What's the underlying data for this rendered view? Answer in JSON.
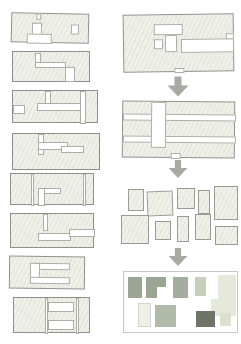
{
  "meta": {
    "icons": [
      "down-arrow-icon"
    ]
  },
  "style": {
    "page_bg": "#ffffff",
    "hatch_fill": "#eef0e9",
    "hatch_line": "#e2e4da",
    "outline": "#8f9089",
    "cut_border": "#adaea6",
    "building_border": "#9a9b93",
    "frame_border": "#c8ccbe",
    "arrow_color": "#a7aaa3"
  },
  "diagram": {
    "left_column_blocks": [
      {
        "id": "plan-block-1",
        "x": 11,
        "y": 13,
        "w": 78,
        "h": 30,
        "tilt": 1.2,
        "cuts": [
          {
            "x": 20,
            "y": 9,
            "w": 10,
            "h": 13
          },
          {
            "x": 15,
            "y": 20,
            "w": 25,
            "h": 10
          },
          {
            "x": 59,
            "y": 10,
            "w": 8,
            "h": 10
          },
          {
            "x": 24,
            "y": 0,
            "w": 5,
            "h": 6
          }
        ]
      },
      {
        "id": "plan-block-2",
        "x": 12,
        "y": 51,
        "w": 78,
        "h": 31,
        "tilt": 0,
        "cuts": [
          {
            "x": 22,
            "y": 1,
            "w": 6,
            "h": 10
          },
          {
            "x": 22,
            "y": 10,
            "w": 31,
            "h": 6
          },
          {
            "x": 52,
            "y": 15,
            "w": 10,
            "h": 15
          }
        ]
      },
      {
        "id": "plan-block-3",
        "x": 12,
        "y": 90,
        "w": 86,
        "h": 33,
        "tilt": 0,
        "cuts": [
          {
            "x": 32,
            "y": 0,
            "w": 6,
            "h": 13
          },
          {
            "x": 24,
            "y": 12,
            "w": 46,
            "h": 8
          },
          {
            "x": 67,
            "y": 0,
            "w": 6,
            "h": 33
          },
          {
            "x": 0,
            "y": 14,
            "w": 12,
            "h": 9
          }
        ]
      },
      {
        "id": "plan-block-4",
        "x": 12,
        "y": 133,
        "w": 88,
        "h": 37,
        "tilt": 0,
        "cuts": [
          {
            "x": 25,
            "y": 0,
            "w": 6,
            "h": 21
          },
          {
            "x": 25,
            "y": 8,
            "w": 30,
            "h": 8
          },
          {
            "x": 48,
            "y": 12,
            "w": 23,
            "h": 7
          }
        ]
      },
      {
        "id": "plan-block-5",
        "x": 10,
        "y": 173,
        "w": 84,
        "h": 32,
        "tilt": 0,
        "cuts": [
          {
            "x": 20,
            "y": 0,
            "w": 3,
            "h": 32
          },
          {
            "x": 27,
            "y": 14,
            "w": 23,
            "h": 6
          },
          {
            "x": 27,
            "y": 14,
            "w": 7,
            "h": 18
          },
          {
            "x": 72,
            "y": 0,
            "w": 3,
            "h": 32
          }
        ]
      },
      {
        "id": "plan-block-6",
        "x": 10,
        "y": 213,
        "w": 84,
        "h": 35,
        "tilt": 0,
        "cuts": [
          {
            "x": 32,
            "y": 0,
            "w": 5,
            "h": 17
          },
          {
            "x": 27,
            "y": 19,
            "w": 33,
            "h": 8
          },
          {
            "x": 58,
            "y": 15,
            "w": 26,
            "h": 8
          }
        ]
      },
      {
        "id": "plan-block-7",
        "x": 9,
        "y": 256,
        "w": 76,
        "h": 33,
        "tilt": 0.6,
        "cuts": [
          {
            "x": 20,
            "y": 6,
            "w": 40,
            "h": 7
          },
          {
            "x": 20,
            "y": 6,
            "w": 10,
            "h": 21
          },
          {
            "x": 20,
            "y": 20,
            "w": 40,
            "h": 7
          }
        ]
      },
      {
        "id": "plan-block-8",
        "x": 13,
        "y": 297,
        "w": 77,
        "h": 36,
        "tilt": 0,
        "cuts": [
          {
            "x": 34,
            "y": 4,
            "w": 26,
            "h": 10
          },
          {
            "x": 34,
            "y": 22,
            "w": 26,
            "h": 10
          },
          {
            "x": 31,
            "y": 0,
            "w": 3,
            "h": 36
          },
          {
            "x": 62,
            "y": 0,
            "w": 3,
            "h": 36
          }
        ]
      }
    ],
    "sequence_blocks": [
      {
        "id": "step-1-superblock",
        "x": 123,
        "y": 14,
        "w": 111,
        "h": 58,
        "tilt": -0.8,
        "cuts": [
          {
            "x": 30,
            "y": 9,
            "w": 29,
            "h": 11
          },
          {
            "x": 41,
            "y": 20,
            "w": 12,
            "h": 17
          },
          {
            "x": 30,
            "y": 24,
            "w": 9,
            "h": 10
          },
          {
            "x": 57,
            "y": 24,
            "w": 53,
            "h": 14
          },
          {
            "x": 102,
            "y": 19,
            "w": 8,
            "h": 6
          },
          {
            "x": 50,
            "y": 53,
            "w": 10,
            "h": 5
          }
        ]
      },
      {
        "id": "step-2-gridded-block",
        "x": 122,
        "y": 101,
        "w": 113,
        "h": 57,
        "tilt": 0.5,
        "cuts": [
          {
            "x": 0,
            "y": 12,
            "w": 113,
            "h": 7
          },
          {
            "x": 0,
            "y": 34,
            "w": 113,
            "h": 7
          },
          {
            "x": 28,
            "y": 0,
            "w": 15,
            "h": 46
          },
          {
            "x": 48,
            "y": 51,
            "w": 10,
            "h": 6
          }
        ]
      }
    ],
    "arrows": [
      {
        "id": "down-arrow-1",
        "x": 167,
        "y": 76,
        "w": 22,
        "h": 21
      },
      {
        "id": "down-arrow-2",
        "x": 167,
        "y": 160,
        "w": 22,
        "h": 18
      },
      {
        "id": "down-arrow-3",
        "x": 167,
        "y": 248,
        "w": 22,
        "h": 18
      }
    ],
    "buildings_panel": {
      "id": "step-3-buildings",
      "x": 121,
      "y": 183,
      "w": 117,
      "h": 62,
      "buildings": [
        {
          "x": 7,
          "y": 6,
          "w": 16,
          "h": 22
        },
        {
          "x": 26,
          "y": 8,
          "w": 26,
          "h": 25,
          "tilt": -2
        },
        {
          "x": 56,
          "y": 5,
          "w": 18,
          "h": 21
        },
        {
          "x": 77,
          "y": 7,
          "w": 12,
          "h": 24
        },
        {
          "x": 93,
          "y": 3,
          "w": 24,
          "h": 34
        },
        {
          "x": 0,
          "y": 32,
          "w": 28,
          "h": 29
        },
        {
          "x": 34,
          "y": 38,
          "w": 16,
          "h": 19
        },
        {
          "x": 56,
          "y": 33,
          "w": 12,
          "h": 26
        },
        {
          "x": 74,
          "y": 31,
          "w": 16,
          "h": 26
        },
        {
          "x": 94,
          "y": 43,
          "w": 23,
          "h": 19
        }
      ]
    },
    "parcels_panel": {
      "id": "step-4-parcels",
      "x": 123,
      "y": 271,
      "w": 115,
      "h": 62,
      "shapes": [
        {
          "x": 4,
          "y": 5,
          "w": 14,
          "h": 21,
          "color": "#9ba594"
        },
        {
          "x": 22,
          "y": 5,
          "w": 20,
          "h": 21,
          "color": "#9ba594"
        },
        {
          "x": 33,
          "y": 15,
          "w": 9,
          "h": 11,
          "color": "#ffffff"
        },
        {
          "x": 49,
          "y": 5,
          "w": 15,
          "h": 21,
          "color": "#a5aca0"
        },
        {
          "x": 71,
          "y": 5,
          "w": 11,
          "h": 19,
          "color": "#c8cebc"
        },
        {
          "x": 94,
          "y": 3,
          "w": 18,
          "h": 26,
          "color": "#e5e9dc"
        },
        {
          "x": 87,
          "y": 27,
          "w": 25,
          "h": 17,
          "color": "#e5e9dc"
        },
        {
          "x": 14,
          "y": 31,
          "w": 13,
          "h": 24,
          "color": "#eef0e6",
          "border": "#d3d6c8"
        },
        {
          "x": 31,
          "y": 33,
          "w": 21,
          "h": 22,
          "color": "#b1b9a9"
        },
        {
          "x": 72,
          "y": 39,
          "w": 19,
          "h": 16,
          "color": "#6e7567"
        },
        {
          "x": 96,
          "y": 41,
          "w": 11,
          "h": 13,
          "color": "#dce1cf"
        }
      ]
    }
  }
}
